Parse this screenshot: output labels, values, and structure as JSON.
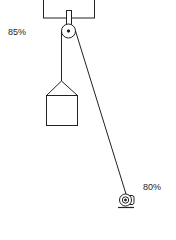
{
  "diagram": {
    "pulley_efficiency_label": "85%",
    "motor_efficiency_label": "80%",
    "components": [
      "ceiling-support",
      "pulley",
      "rope",
      "load",
      "motor"
    ],
    "line_color": "#222222",
    "background": "#ffffff"
  }
}
